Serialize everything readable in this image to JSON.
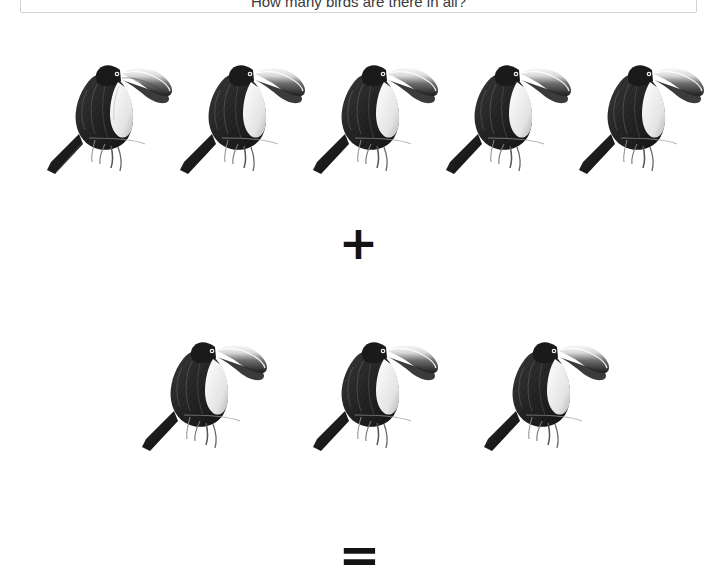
{
  "header": {
    "text": "How many birds are there in all?"
  },
  "puzzle": {
    "type": "visual-addition",
    "subject_icon": "toucan-bird-illustration",
    "operator_plus": "+",
    "operator_equals": "=",
    "groups": [
      {
        "name": "first-addend",
        "count": 5,
        "label": "5"
      },
      {
        "name": "second-addend",
        "count": 3,
        "label": "3"
      }
    ],
    "answer_shown": false,
    "colors": {
      "background": "#ffffff",
      "ink": "#131313",
      "panel_border": "#d2d2d4",
      "plumage_dark": "#2b2b2b",
      "plumage_mid": "#595959",
      "throat_light": "#f2f2f2",
      "beak_light": "#e8e8e8"
    },
    "layout": {
      "row1_left_positions": [
        25,
        158,
        291,
        424,
        557
      ],
      "row2_left_positions": [
        120,
        291,
        462
      ],
      "row1_top": 28,
      "row2_top": 305,
      "plus_center": [
        358,
        238
      ],
      "equals_center": [
        360,
        550
      ]
    }
  }
}
